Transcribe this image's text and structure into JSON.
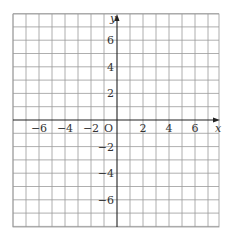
{
  "chart_data": {
    "type": "scatter",
    "title": "",
    "xlabel": "x",
    "ylabel": "y",
    "origin_label": "O",
    "xlim": [
      -8,
      7.8
    ],
    "ylim": [
      -8,
      8
    ],
    "grid": true,
    "grid_step": 1,
    "x_ticks": [
      -6,
      -4,
      -2,
      2,
      4,
      6
    ],
    "y_ticks": [
      6,
      4,
      2,
      -2,
      -4,
      -6
    ],
    "x_tick_labels": [
      "−6",
      "−4",
      "−2",
      "2",
      "4",
      "6"
    ],
    "y_tick_labels": [
      "6",
      "4",
      "2",
      "−2",
      "−4",
      "−6"
    ],
    "series": [],
    "legend": null
  },
  "colors": {
    "grid": "#9a9a9a",
    "axis": "#222222",
    "text": "#333333",
    "background": "#ffffff"
  },
  "layout": {
    "left_px": 13,
    "right_px": 219,
    "top_px": 14,
    "bottom_px": 227,
    "origin_x_px": 117,
    "origin_y_px": 120,
    "unit_x_px": 13.0,
    "unit_y_px": 13.3
  }
}
